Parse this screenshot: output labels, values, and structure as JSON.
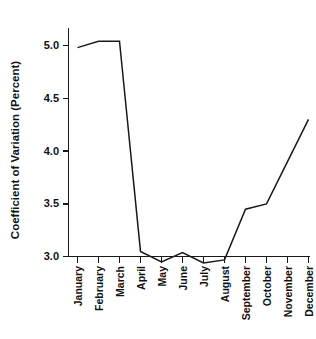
{
  "chart_data": {
    "type": "line",
    "title": "",
    "xlabel": "",
    "ylabel": "Coefficient of Variation (Percent)",
    "categories": [
      "January",
      "February",
      "March",
      "April",
      "May",
      "June",
      "July",
      "August",
      "September",
      "October",
      "November",
      "December"
    ],
    "values": [
      4.98,
      5.04,
      5.04,
      3.05,
      2.95,
      3.04,
      2.94,
      2.97,
      3.45,
      3.5,
      3.9,
      4.3
    ],
    "series": [
      {
        "name": "Coefficient of Variation",
        "values": [
          4.98,
          5.04,
          5.04,
          3.05,
          2.95,
          3.04,
          2.94,
          2.97,
          3.45,
          3.5,
          3.9,
          4.3
        ]
      }
    ],
    "ylim": [
      3.0,
      5.0
    ],
    "yticks": [
      3.0,
      3.5,
      4.0,
      4.5,
      5.0
    ],
    "ytick_labels": [
      "3.0",
      "3.5",
      "4.0",
      "4.5",
      "5.0"
    ],
    "grid": false,
    "legend": false,
    "legend_position": "none",
    "line_color": "#1a1a1a",
    "background_color": "#ffffff"
  },
  "axes": {
    "y_label": "Coefficient of Variation (Percent)",
    "y_tick_labels": [
      "5.0",
      "4.5",
      "4.0",
      "3.5",
      "3.0"
    ],
    "x_tick_labels": [
      "January",
      "February",
      "March",
      "April",
      "May",
      "June",
      "July",
      "August",
      "September",
      "October",
      "November",
      "December"
    ]
  }
}
